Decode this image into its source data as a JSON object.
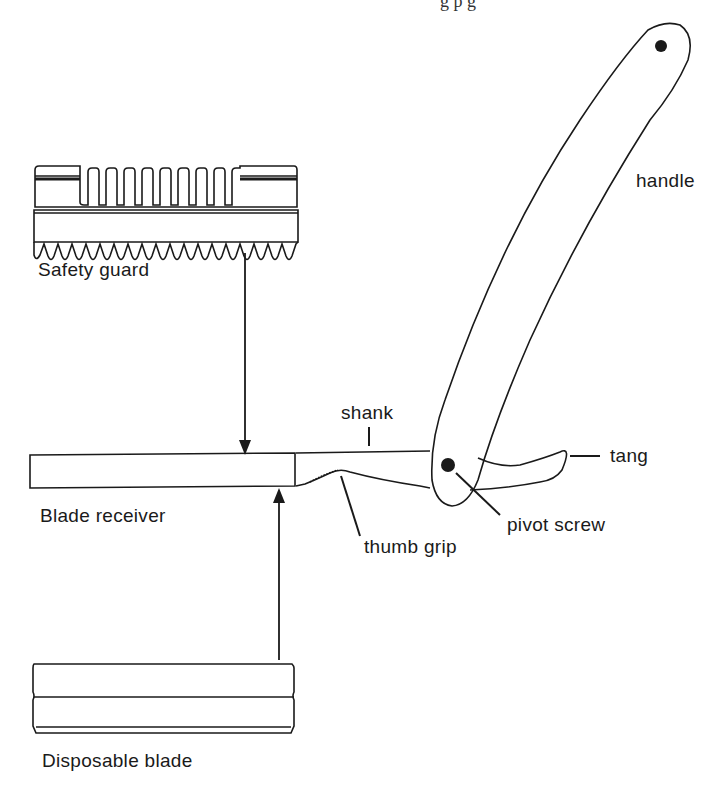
{
  "diagram": {
    "type": "labeled-parts-diagram",
    "clipped_header_fragment": "g    p  g",
    "labels": {
      "safety_guard": "Safety guard",
      "blade_receiver": "Blade receiver",
      "disposable_blade": "Disposable blade",
      "shank": "shank",
      "thumb_grip": "thumb grip",
      "pivot_screw": "pivot screw",
      "tang": "tang",
      "handle": "handle"
    },
    "colors": {
      "ink": "#1a1a1a",
      "background": "#ffffff"
    }
  }
}
